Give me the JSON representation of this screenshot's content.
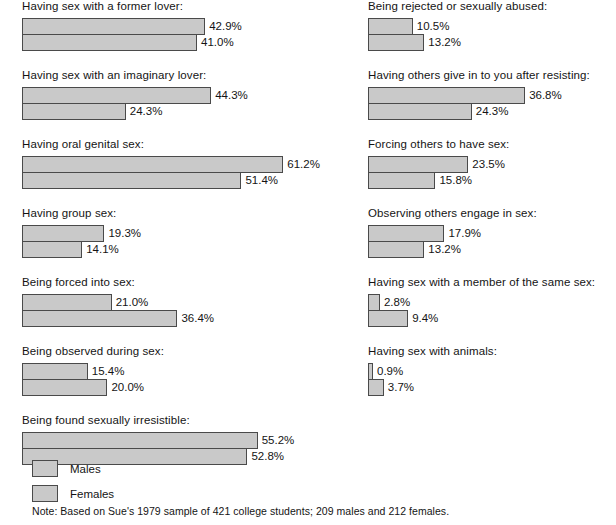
{
  "chart_data": {
    "type": "bar",
    "orientation": "horizontal",
    "title": "",
    "xlabel": "",
    "ylabel": "",
    "xlim": [
      0,
      65
    ],
    "grid": false,
    "legend_position": "bottom-left",
    "value_suffix": "%",
    "series": [
      {
        "name": "Males",
        "values": [
          42.9,
          44.3,
          61.2,
          19.3,
          21.0,
          15.4,
          55.2,
          10.5,
          36.8,
          23.5,
          17.9,
          2.8,
          0.9
        ]
      },
      {
        "name": "Females",
        "values": [
          41.0,
          24.3,
          51.4,
          14.1,
          36.4,
          20.0,
          52.8,
          13.2,
          24.3,
          15.8,
          13.2,
          9.4,
          3.7
        ]
      }
    ],
    "categories": [
      "Having sex with a former lover:",
      "Having sex with an imaginary lover:",
      "Having oral genital sex:",
      "Having group sex:",
      "Being forced into sex:",
      "Being observed during sex:",
      "Being found sexually irresistible:",
      "Being rejected or sexually abused:",
      "Having others give in to you after resisting:",
      "Forcing others to have sex:",
      "Observing others engage in sex:",
      "Having sex with a member of the same sex:",
      "Having sex with animals:"
    ],
    "note": "Note: Based on Sue's 1979 sample of 421 college students; 209 males and 212 females."
  },
  "columns": {
    "left": {
      "groups": [
        {
          "label": "Having sex with a former lover:",
          "bars": [
            {
              "series": "Males",
              "value": 42.9,
              "value_label": "42.9%"
            },
            {
              "series": "Females",
              "value": 41.0,
              "value_label": "41.0%"
            }
          ]
        },
        {
          "label": "Having sex with an imaginary lover:",
          "bars": [
            {
              "series": "Males",
              "value": 44.3,
              "value_label": "44.3%"
            },
            {
              "series": "Females",
              "value": 24.3,
              "value_label": "24.3%"
            }
          ]
        },
        {
          "label": "Having oral genital sex:",
          "bars": [
            {
              "series": "Males",
              "value": 61.2,
              "value_label": "61.2%"
            },
            {
              "series": "Females",
              "value": 51.4,
              "value_label": "51.4%"
            }
          ]
        },
        {
          "label": "Having group sex:",
          "bars": [
            {
              "series": "Males",
              "value": 19.3,
              "value_label": "19.3%"
            },
            {
              "series": "Females",
              "value": 14.1,
              "value_label": "14.1%"
            }
          ]
        },
        {
          "label": "Being forced into sex:",
          "bars": [
            {
              "series": "Males",
              "value": 21.0,
              "value_label": "21.0%"
            },
            {
              "series": "Females",
              "value": 36.4,
              "value_label": "36.4%"
            }
          ]
        },
        {
          "label": "Being observed during sex:",
          "bars": [
            {
              "series": "Males",
              "value": 15.4,
              "value_label": "15.4%"
            },
            {
              "series": "Females",
              "value": 20.0,
              "value_label": "20.0%"
            }
          ]
        },
        {
          "label": "Being found sexually irresistible:",
          "bars": [
            {
              "series": "Males",
              "value": 55.2,
              "value_label": "55.2%"
            },
            {
              "series": "Females",
              "value": 52.8,
              "value_label": "52.8%"
            }
          ]
        }
      ]
    },
    "right": {
      "groups": [
        {
          "label": "Being rejected or sexually abused:",
          "bars": [
            {
              "series": "Males",
              "value": 10.5,
              "value_label": "10.5%"
            },
            {
              "series": "Females",
              "value": 13.2,
              "value_label": "13.2%"
            }
          ]
        },
        {
          "label": "Having others give in to you after resisting:",
          "bars": [
            {
              "series": "Males",
              "value": 36.8,
              "value_label": "36.8%"
            },
            {
              "series": "Females",
              "value": 24.3,
              "value_label": "24.3%"
            }
          ]
        },
        {
          "label": "Forcing others to have sex:",
          "bars": [
            {
              "series": "Males",
              "value": 23.5,
              "value_label": "23.5%"
            },
            {
              "series": "Females",
              "value": 15.8,
              "value_label": "15.8%"
            }
          ]
        },
        {
          "label": "Observing others engage in sex:",
          "bars": [
            {
              "series": "Males",
              "value": 17.9,
              "value_label": "17.9%"
            },
            {
              "series": "Females",
              "value": 13.2,
              "value_label": "13.2%"
            }
          ]
        },
        {
          "label": "Having sex with a member of the same sex:",
          "bars": [
            {
              "series": "Males",
              "value": 2.8,
              "value_label": "2.8%"
            },
            {
              "series": "Females",
              "value": 9.4,
              "value_label": "9.4%"
            }
          ]
        },
        {
          "label": "Having sex with animals:",
          "bars": [
            {
              "series": "Males",
              "value": 0.9,
              "value_label": "0.9%"
            },
            {
              "series": "Females",
              "value": 3.7,
              "value_label": "3.7%"
            }
          ]
        }
      ]
    }
  },
  "legend": {
    "items": [
      {
        "label": "Males",
        "color": "#c9c9c9"
      },
      {
        "label": "Females",
        "color": "#c9c9c9"
      }
    ]
  },
  "note": "Note: Based on Sue's 1979 sample of 421 college students; 209 males and 212 females.",
  "style": {
    "bar_fill": "#c9c9c9",
    "bar_border": "#4a4a4a",
    "text_color": "#141414",
    "background": "#ffffff",
    "px_per_percent": 4.27,
    "min_bar_px": 5
  }
}
